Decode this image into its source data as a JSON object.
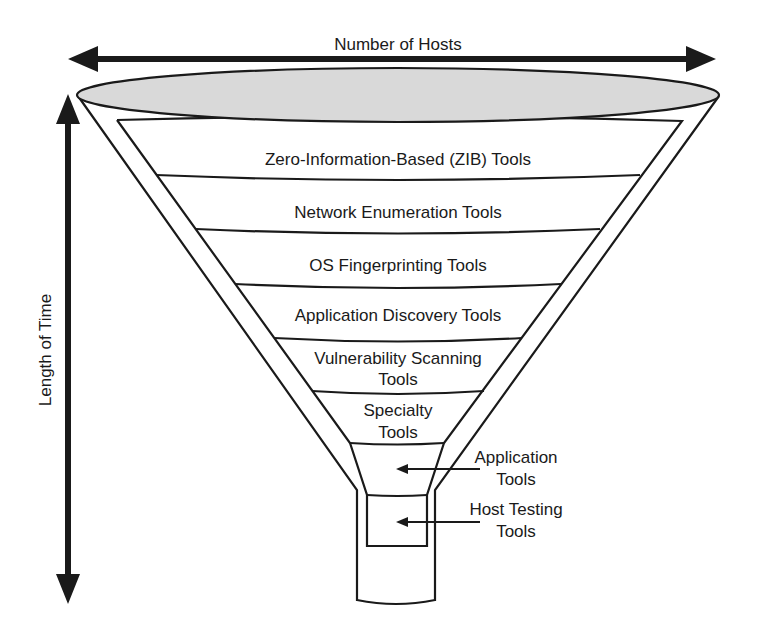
{
  "diagram": {
    "type": "funnel",
    "axes": {
      "horizontal_label": "Number of Hosts",
      "vertical_label": "Length of Time"
    },
    "layers": [
      {
        "label": "Zero-Information-Based (ZIB) Tools",
        "lines": [
          "Zero-Information-Based (ZIB) Tools"
        ]
      },
      {
        "label": "Network Enumeration Tools",
        "lines": [
          "Network Enumeration Tools"
        ]
      },
      {
        "label": "OS Fingerprinting Tools",
        "lines": [
          "OS Fingerprinting Tools"
        ]
      },
      {
        "label": "Application Discovery Tools",
        "lines": [
          "Application Discovery Tools"
        ]
      },
      {
        "label": "Vulnerability Scanning Tools",
        "lines": [
          "Vulnerability Scanning",
          "Tools"
        ]
      },
      {
        "label": "Specialty Tools",
        "lines": [
          "Specialty",
          "Tools"
        ]
      }
    ],
    "callouts": [
      {
        "label": "Application Tools",
        "lines": [
          "Application",
          "Tools"
        ]
      },
      {
        "label": "Host Testing Tools",
        "lines": [
          "Host Testing",
          "Tools"
        ]
      }
    ],
    "colors": {
      "line": "#1a1a1a",
      "funnel_top_fill": "#d9d9d9",
      "background": "#ffffff"
    }
  }
}
